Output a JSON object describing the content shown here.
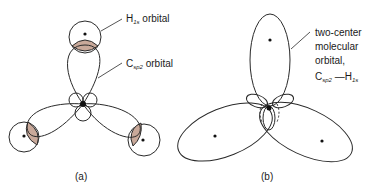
{
  "figure": {
    "panel_a": {
      "caption": "(a)",
      "label_h1s": "H",
      "label_h1s_sub": "1s",
      "label_h1s_rest": " orbital",
      "label_csp2": "C",
      "label_csp2_sub": "sp2",
      "label_csp2_rest": " orbital"
    },
    "panel_b": {
      "caption": "(b)",
      "label_line1": "two-center",
      "label_line2": "molecular",
      "label_line3": "orbital,",
      "label_line4_c": "C",
      "label_line4_sub": "sp2",
      "label_line4_bond": " —H",
      "label_line4_sub2": "1s"
    },
    "colors": {
      "overlap_fill": "#c9a99a",
      "stroke": "#2a2a2a"
    }
  }
}
